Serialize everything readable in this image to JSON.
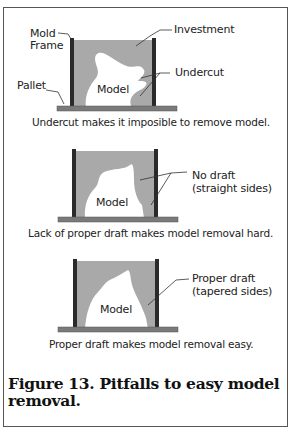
{
  "panels": [
    {
      "labels": {
        "mold_frame": [
          "Mold",
          "Frame"
        ],
        "investment": "Investment",
        "undercut": "Undercut",
        "pallet": "Pallet",
        "model": "Model"
      },
      "caption": "Undercut makes it imposible to remove model."
    },
    {
      "labels": {
        "model": "Model",
        "callout_line1": "No draft",
        "callout_line2": "(straight sides)"
      },
      "caption": "Lack of proper draft makes model removal hard."
    },
    {
      "labels": {
        "model": "Model",
        "callout_line1": "Proper draft",
        "callout_line2": "(tapered sides)"
      },
      "caption": "Proper draft makes model removal easy."
    }
  ],
  "figure_caption": "Figure 13.  Pitfalls to easy model removal.",
  "colors": {
    "investment_fill": "#a9a9a9",
    "mold_frame": "#2a2a2a",
    "pallet": "#7a7a7a",
    "model_fill": "#ffffff"
  }
}
